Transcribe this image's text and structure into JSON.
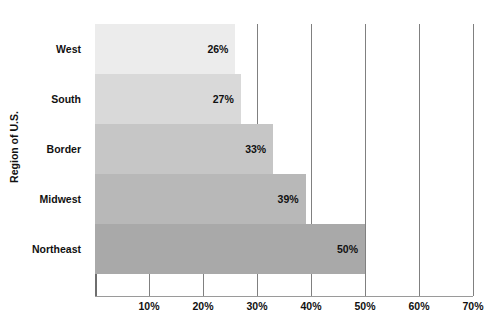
{
  "chart_data": {
    "type": "bar",
    "orientation": "horizontal",
    "title": "",
    "xlabel": "",
    "ylabel": "Region of U.S.",
    "categories": [
      "West",
      "South",
      "Border",
      "Midwest",
      "Northeast"
    ],
    "values": [
      26,
      27,
      33,
      39,
      50
    ],
    "value_labels": [
      "26%",
      "27%",
      "33%",
      "39%",
      "50%"
    ],
    "bar_colors": [
      "#ececec",
      "#d9d9d9",
      "#c6c6c6",
      "#b8b8b8",
      "#a9a9a9"
    ],
    "xlim": [
      0,
      70
    ],
    "xtick_values": [
      10,
      20,
      30,
      40,
      50,
      60,
      70
    ],
    "xtick_labels": [
      "10%",
      "20%",
      "30%",
      "40%",
      "50%",
      "60%",
      "70%"
    ],
    "grid": true,
    "grid_axis": "x",
    "legend": false,
    "axis_color": "#808080"
  },
  "layout": {
    "plot_left": 95,
    "plot_top": 24,
    "plot_width": 378,
    "plot_height": 272,
    "px_per_unit": 5.33,
    "bar_height": 50,
    "band_height": 50
  }
}
